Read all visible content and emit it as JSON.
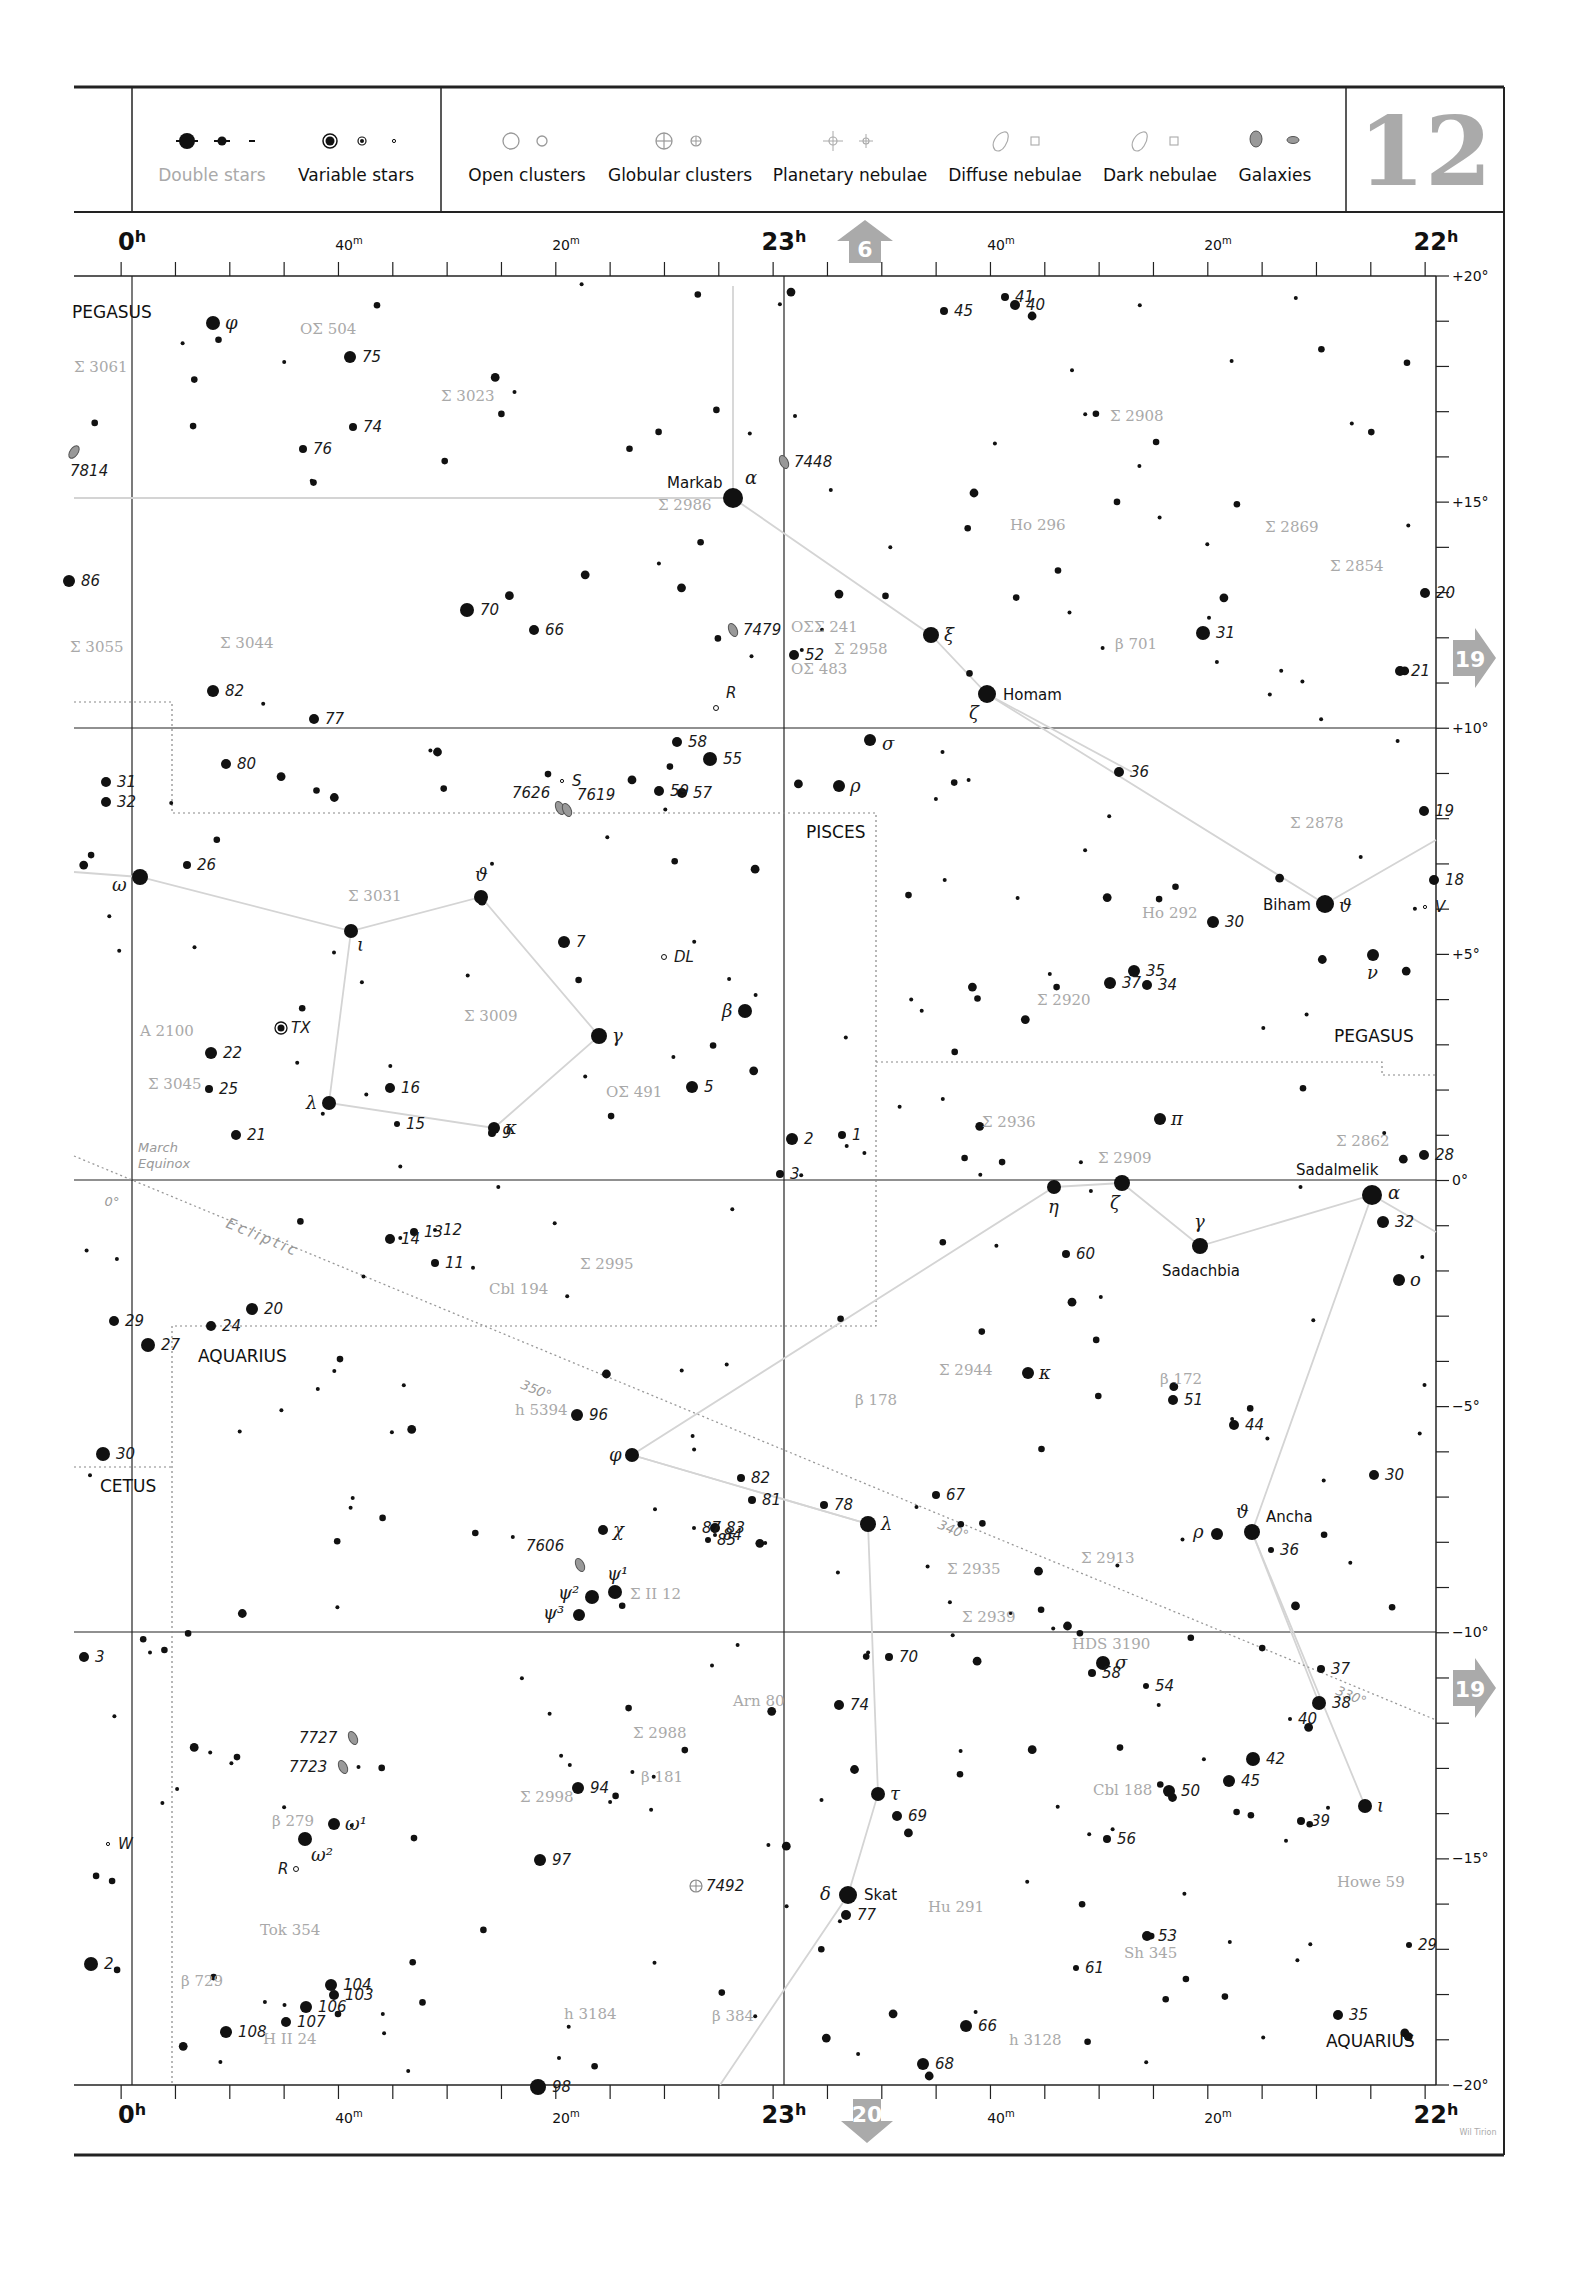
{
  "page": {
    "number": "12",
    "credit": "Wil Tirion"
  },
  "legend": {
    "items": [
      {
        "label": "Double stars",
        "muted": true
      },
      {
        "label": "Variable stars"
      },
      {
        "label": "Open clusters"
      },
      {
        "label": "Globular clusters"
      },
      {
        "label": "Planetary nebulae"
      },
      {
        "label": "Diffuse nebulae"
      },
      {
        "label": "Dark nebulae"
      },
      {
        "label": "Galaxies"
      }
    ]
  },
  "navigation": {
    "up": "6",
    "right_upper": "19",
    "right_lower": "19",
    "down": "20"
  },
  "axes": {
    "ra_top": [
      {
        "label": "0h",
        "major": true,
        "x": 132
      },
      {
        "label": "40m",
        "x": 349
      },
      {
        "label": "20m",
        "x": 566
      },
      {
        "label": "23h",
        "major": true,
        "x": 784
      },
      {
        "label": "40m",
        "x": 1001
      },
      {
        "label": "20m",
        "x": 1218
      },
      {
        "label": "22h",
        "major": true,
        "x": 1436
      }
    ],
    "dec_right": [
      {
        "label": "+20°",
        "y": 276
      },
      {
        "label": "+15°",
        "y": 502
      },
      {
        "label": "+10°",
        "y": 728
      },
      {
        "label": "+5°",
        "y": 954
      },
      {
        "label": "0°",
        "y": 1180
      },
      {
        "label": "−5°",
        "y": 1406
      },
      {
        "label": "−10°",
        "y": 1632
      },
      {
        "label": "−15°",
        "y": 1858
      },
      {
        "label": "−20°",
        "y": 2085
      }
    ]
  },
  "constellations": [
    {
      "name": "PEGASUS",
      "x": 72,
      "y": 318
    },
    {
      "name": "PISCES",
      "x": 806,
      "y": 838
    },
    {
      "name": "PEGASUS",
      "x": 1334,
      "y": 1042
    },
    {
      "name": "AQUARIUS",
      "x": 198,
      "y": 1362
    },
    {
      "name": "CETUS",
      "x": 100,
      "y": 1492
    },
    {
      "name": "AQUARIUS",
      "x": 1326,
      "y": 2047
    }
  ],
  "ecliptic": {
    "label": "Ecliptic",
    "marks": [
      {
        "label": "0°",
        "x": 112,
        "y": 1198
      },
      {
        "label": "350°",
        "x": 520,
        "y": 1380
      },
      {
        "label": "340°",
        "x": 937,
        "y": 1523
      },
      {
        "label": "330°",
        "x": 1340,
        "y": 1691
      }
    ],
    "equinox": [
      "March",
      "Equinox"
    ]
  },
  "named_stars": [
    {
      "name": "Markab",
      "greek": "α",
      "x": 733,
      "y": 498,
      "r": 10
    },
    {
      "name": "Homam",
      "greek": "ζ",
      "x": 987,
      "y": 694,
      "r": 9
    },
    {
      "name": "Biham",
      "greek": "ϑ",
      "x": 1325,
      "y": 904,
      "r": 9
    },
    {
      "name": "Sadalmelik",
      "greek": "α",
      "x": 1372,
      "y": 1195,
      "r": 10
    },
    {
      "name": "Sadachbia",
      "greek": "γ",
      "x": 1200,
      "y": 1246,
      "r": 8
    },
    {
      "name": "Ancha",
      "greek": "ϑ",
      "x": 1252,
      "y": 1532,
      "r": 8
    },
    {
      "name": "Skat",
      "greek": "δ",
      "x": 848,
      "y": 1895,
      "r": 9
    }
  ],
  "greek_stars": [
    {
      "g": "φ",
      "x": 213,
      "y": 323,
      "r": 7
    },
    {
      "g": "ξ",
      "x": 931,
      "y": 635,
      "r": 8
    },
    {
      "g": "σ",
      "x": 870,
      "y": 740,
      "r": 6
    },
    {
      "g": "ρ",
      "x": 839,
      "y": 786,
      "r": 6
    },
    {
      "g": "ω",
      "x": 140,
      "y": 877,
      "r": 8
    },
    {
      "g": "ϑ",
      "x": 481,
      "y": 897,
      "r": 7
    },
    {
      "g": "ι",
      "x": 351,
      "y": 931,
      "r": 7
    },
    {
      "g": "β",
      "x": 745,
      "y": 1011,
      "r": 7
    },
    {
      "g": "γ",
      "x": 599,
      "y": 1036,
      "r": 8
    },
    {
      "g": "λ",
      "x": 329,
      "y": 1103,
      "r": 7
    },
    {
      "g": "κ",
      "x": 494,
      "y": 1128,
      "r": 6
    },
    {
      "g": "ν",
      "x": 1373,
      "y": 955,
      "r": 6
    },
    {
      "g": "π",
      "x": 1160,
      "y": 1119,
      "r": 6
    },
    {
      "g": "η",
      "x": 1054,
      "y": 1187,
      "r": 7
    },
    {
      "g": "ζ",
      "x": 1122,
      "y": 1183,
      "r": 8
    },
    {
      "g": "ο",
      "x": 1399,
      "y": 1280,
      "r": 6
    },
    {
      "g": "κ",
      "x": 1028,
      "y": 1373,
      "r": 6
    },
    {
      "g": "φ",
      "x": 632,
      "y": 1455,
      "r": 7
    },
    {
      "g": "λ",
      "x": 868,
      "y": 1524,
      "r": 8
    },
    {
      "g": "ρ",
      "x": 1217,
      "y": 1534,
      "r": 6
    },
    {
      "g": "χ",
      "x": 603,
      "y": 1530,
      "r": 5
    },
    {
      "g": "ψ¹",
      "x": 615,
      "y": 1592,
      "r": 7
    },
    {
      "g": "ψ²",
      "x": 592,
      "y": 1597,
      "r": 7
    },
    {
      "g": "ψ³",
      "x": 579,
      "y": 1615,
      "r": 6
    },
    {
      "g": "σ",
      "x": 1103,
      "y": 1663,
      "r": 7
    },
    {
      "g": "τ",
      "x": 878,
      "y": 1794,
      "r": 7
    },
    {
      "g": "ι",
      "x": 1365,
      "y": 1806,
      "r": 7
    },
    {
      "g": "ω¹",
      "x": 334,
      "y": 1824,
      "r": 6
    },
    {
      "g": "ω²",
      "x": 305,
      "y": 1839,
      "r": 7
    }
  ],
  "numbered_stars": [
    {
      "n": "75",
      "x": 350,
      "y": 357,
      "r": 6
    },
    {
      "n": "74",
      "x": 353,
      "y": 427,
      "r": 4
    },
    {
      "n": "76",
      "x": 303,
      "y": 449,
      "r": 4
    },
    {
      "n": "7814",
      "x": 86,
      "y": 462,
      "r": 0,
      "galaxy": true
    },
    {
      "n": "45",
      "x": 944,
      "y": 311,
      "r": 4
    },
    {
      "n": "41",
      "x": 1005,
      "y": 297,
      "r": 4
    },
    {
      "n": "40",
      "x": 1015,
      "y": 305,
      "r": 5
    },
    {
      "n": "86",
      "x": 69,
      "y": 581,
      "r": 6
    },
    {
      "n": "70",
      "x": 467,
      "y": 610,
      "r": 7
    },
    {
      "n": "66",
      "x": 534,
      "y": 630,
      "r": 5
    },
    {
      "n": "82",
      "x": 213,
      "y": 691,
      "r": 6
    },
    {
      "n": "77",
      "x": 314,
      "y": 719,
      "r": 5
    },
    {
      "n": "80",
      "x": 226,
      "y": 764,
      "r": 5
    },
    {
      "n": "31",
      "x": 106,
      "y": 782,
      "r": 5
    },
    {
      "n": "32",
      "x": 106,
      "y": 802,
      "r": 5
    },
    {
      "n": "52",
      "x": 794,
      "y": 655,
      "r": 5
    },
    {
      "n": "58",
      "x": 677,
      "y": 742,
      "r": 5
    },
    {
      "n": "55",
      "x": 710,
      "y": 759,
      "r": 7
    },
    {
      "n": "59",
      "x": 659,
      "y": 791,
      "r": 5
    },
    {
      "n": "57",
      "x": 682,
      "y": 793,
      "r": 5
    },
    {
      "n": "31",
      "x": 1203,
      "y": 633,
      "r": 7
    },
    {
      "n": "20",
      "x": 1425,
      "y": 593,
      "r": 5
    },
    {
      "n": "21",
      "x": 1400,
      "y": 671,
      "r": 5
    },
    {
      "n": "36",
      "x": 1119,
      "y": 772,
      "r": 5
    },
    {
      "n": "19",
      "x": 1424,
      "y": 811,
      "r": 5
    },
    {
      "n": "18",
      "x": 1434,
      "y": 880,
      "r": 5
    },
    {
      "n": "26",
      "x": 187,
      "y": 865,
      "r": 4
    },
    {
      "n": "7",
      "x": 564,
      "y": 942,
      "r": 6
    },
    {
      "n": "30",
      "x": 1213,
      "y": 922,
      "r": 6
    },
    {
      "n": "35",
      "x": 1134,
      "y": 971,
      "r": 6
    },
    {
      "n": "37",
      "x": 1110,
      "y": 983,
      "r": 6
    },
    {
      "n": "34",
      "x": 1147,
      "y": 985,
      "r": 5
    },
    {
      "n": "22",
      "x": 211,
      "y": 1053,
      "r": 6
    },
    {
      "n": "25",
      "x": 209,
      "y": 1089,
      "r": 4
    },
    {
      "n": "16",
      "x": 390,
      "y": 1088,
      "r": 5
    },
    {
      "n": "5",
      "x": 692,
      "y": 1087,
      "r": 6
    },
    {
      "n": "21",
      "x": 236,
      "y": 1135,
      "r": 5
    },
    {
      "n": "15",
      "x": 397,
      "y": 1124,
      "r": 3
    },
    {
      "n": "9",
      "x": 492,
      "y": 1133,
      "r": 4
    },
    {
      "n": "2",
      "x": 792,
      "y": 1139,
      "r": 6
    },
    {
      "n": "1",
      "x": 842,
      "y": 1135,
      "r": 4
    },
    {
      "n": "3",
      "x": 780,
      "y": 1174,
      "r": 4
    },
    {
      "n": "28",
      "x": 1424,
      "y": 1155,
      "r": 5
    },
    {
      "n": "32",
      "x": 1383,
      "y": 1222,
      "r": 6
    },
    {
      "n": "13",
      "x": 414,
      "y": 1232,
      "r": 4
    },
    {
      "n": "12",
      "x": 435,
      "y": 1230,
      "r": 2
    },
    {
      "n": "14",
      "x": 390,
      "y": 1239,
      "r": 5
    },
    {
      "n": "11",
      "x": 435,
      "y": 1263,
      "r": 4
    },
    {
      "n": "60",
      "x": 1066,
      "y": 1254,
      "r": 4
    },
    {
      "n": "29",
      "x": 114,
      "y": 1321,
      "r": 5
    },
    {
      "n": "27",
      "x": 148,
      "y": 1345,
      "r": 7
    },
    {
      "n": "24",
      "x": 211,
      "y": 1326,
      "r": 5
    },
    {
      "n": "20",
      "x": 252,
      "y": 1309,
      "r": 6
    },
    {
      "n": "96",
      "x": 577,
      "y": 1415,
      "r": 6
    },
    {
      "n": "51",
      "x": 1173,
      "y": 1400,
      "r": 5
    },
    {
      "n": "44",
      "x": 1234,
      "y": 1425,
      "r": 5
    },
    {
      "n": "30",
      "x": 103,
      "y": 1454,
      "r": 7
    },
    {
      "n": "30",
      "x": 1374,
      "y": 1475,
      "r": 5
    },
    {
      "n": "82",
      "x": 741,
      "y": 1478,
      "r": 4
    },
    {
      "n": "81",
      "x": 752,
      "y": 1500,
      "r": 4
    },
    {
      "n": "78",
      "x": 824,
      "y": 1505,
      "r": 4
    },
    {
      "n": "67",
      "x": 936,
      "y": 1495,
      "r": 4
    },
    {
      "n": "87",
      "x": 694,
      "y": 1528,
      "r": 2
    },
    {
      "n": "83",
      "x": 715,
      "y": 1528,
      "r": 5
    },
    {
      "n": "84",
      "x": 715,
      "y": 1535,
      "r": 2
    },
    {
      "n": "85",
      "x": 708,
      "y": 1540,
      "r": 3
    },
    {
      "n": "36",
      "x": 1271,
      "y": 1550,
      "r": 3
    },
    {
      "n": "3",
      "x": 84,
      "y": 1657,
      "r": 5
    },
    {
      "n": "70",
      "x": 889,
      "y": 1657,
      "r": 4
    },
    {
      "n": "58",
      "x": 1092,
      "y": 1673,
      "r": 4
    },
    {
      "n": "54",
      "x": 1146,
      "y": 1686,
      "r": 3
    },
    {
      "n": "37",
      "x": 1321,
      "y": 1669,
      "r": 4
    },
    {
      "n": "38",
      "x": 1319,
      "y": 1703,
      "r": 7
    },
    {
      "n": "40",
      "x": 1290,
      "y": 1719,
      "r": 2
    },
    {
      "n": "74",
      "x": 839,
      "y": 1705,
      "r": 5
    },
    {
      "n": "42",
      "x": 1253,
      "y": 1759,
      "r": 7
    },
    {
      "n": "45",
      "x": 1229,
      "y": 1781,
      "r": 6
    },
    {
      "n": "50",
      "x": 1169,
      "y": 1791,
      "r": 6
    },
    {
      "n": "94",
      "x": 578,
      "y": 1788,
      "r": 6
    },
    {
      "n": "69",
      "x": 897,
      "y": 1816,
      "r": 5
    },
    {
      "n": "39",
      "x": 1301,
      "y": 1821,
      "r": 4
    },
    {
      "n": "56",
      "x": 1107,
      "y": 1839,
      "r": 4
    },
    {
      "n": "97",
      "x": 540,
      "y": 1860,
      "r": 6
    },
    {
      "n": "77",
      "x": 846,
      "y": 1915,
      "r": 5
    },
    {
      "n": "53",
      "x": 1147,
      "y": 1936,
      "r": 5
    },
    {
      "n": "29",
      "x": 1409,
      "y": 1945,
      "r": 3
    },
    {
      "n": "2",
      "x": 91,
      "y": 1964,
      "r": 7
    },
    {
      "n": "61",
      "x": 1076,
      "y": 1968,
      "r": 3
    },
    {
      "n": "104",
      "x": 331,
      "y": 1985,
      "r": 6
    },
    {
      "n": "103",
      "x": 334,
      "y": 1995,
      "r": 5
    },
    {
      "n": "106",
      "x": 306,
      "y": 2007,
      "r": 6
    },
    {
      "n": "107",
      "x": 286,
      "y": 2022,
      "r": 5
    },
    {
      "n": "108",
      "x": 226,
      "y": 2032,
      "r": 6
    },
    {
      "n": "35",
      "x": 1338,
      "y": 2015,
      "r": 5
    },
    {
      "n": "66",
      "x": 966,
      "y": 2026,
      "r": 6
    },
    {
      "n": "68",
      "x": 923,
      "y": 2064,
      "r": 6
    },
    {
      "n": "98",
      "x": 538,
      "y": 2087,
      "r": 8
    }
  ],
  "double_star_labels": [
    {
      "t": "OΣ 504",
      "x": 300,
      "y": 334
    },
    {
      "t": "Σ 3061",
      "x": 74,
      "y": 372
    },
    {
      "t": "Σ 3023",
      "x": 441,
      "y": 401
    },
    {
      "t": "Σ 2908",
      "x": 1110,
      "y": 421
    },
    {
      "t": "Σ 2986",
      "x": 658,
      "y": 510
    },
    {
      "t": "Ho 296",
      "x": 1010,
      "y": 530
    },
    {
      "t": "Σ 2869",
      "x": 1265,
      "y": 532
    },
    {
      "t": "Σ 2854",
      "x": 1330,
      "y": 571
    },
    {
      "t": "Σ 3055",
      "x": 70,
      "y": 652
    },
    {
      "t": "Σ 3044",
      "x": 220,
      "y": 648
    },
    {
      "t": "OΣΣ 241",
      "x": 791,
      "y": 632
    },
    {
      "t": "Σ 2958",
      "x": 834,
      "y": 654
    },
    {
      "t": "OΣ 483",
      "x": 791,
      "y": 674
    },
    {
      "t": "β 701",
      "x": 1115,
      "y": 649
    },
    {
      "t": "Σ 2878",
      "x": 1290,
      "y": 828
    },
    {
      "t": "Σ 3031",
      "x": 348,
      "y": 901
    },
    {
      "t": "Ho 292",
      "x": 1142,
      "y": 918
    },
    {
      "t": "Σ 2920",
      "x": 1037,
      "y": 1005
    },
    {
      "t": "Σ 3009",
      "x": 464,
      "y": 1021
    },
    {
      "t": "A 2100",
      "x": 140,
      "y": 1036
    },
    {
      "t": "Σ 3045",
      "x": 148,
      "y": 1089
    },
    {
      "t": "OΣ 491",
      "x": 606,
      "y": 1097
    },
    {
      "t": "Σ 2936",
      "x": 982,
      "y": 1127
    },
    {
      "t": "Σ 2909",
      "x": 1098,
      "y": 1163
    },
    {
      "t": "Σ 2862",
      "x": 1336,
      "y": 1146
    },
    {
      "t": "Σ 2995",
      "x": 580,
      "y": 1269
    },
    {
      "t": "Cbl 194",
      "x": 489,
      "y": 1294
    },
    {
      "t": "Σ 2944",
      "x": 939,
      "y": 1375
    },
    {
      "t": "β 178",
      "x": 855,
      "y": 1405
    },
    {
      "t": "β 172",
      "x": 1160,
      "y": 1384
    },
    {
      "t": "h 5394",
      "x": 515,
      "y": 1415
    },
    {
      "t": "Σ II 12",
      "x": 630,
      "y": 1599
    },
    {
      "t": "Σ 2935",
      "x": 947,
      "y": 1574
    },
    {
      "t": "Σ 2913",
      "x": 1081,
      "y": 1563
    },
    {
      "t": "Σ 2939",
      "x": 962,
      "y": 1622
    },
    {
      "t": "HDS 3190",
      "x": 1072,
      "y": 1649
    },
    {
      "t": "Arn 80",
      "x": 733,
      "y": 1706
    },
    {
      "t": "Σ 2988",
      "x": 633,
      "y": 1738
    },
    {
      "t": "β 181",
      "x": 641,
      "y": 1782
    },
    {
      "t": "Σ 2998",
      "x": 520,
      "y": 1802
    },
    {
      "t": "β 279",
      "x": 272,
      "y": 1826
    },
    {
      "t": "Cbl 188",
      "x": 1093,
      "y": 1795
    },
    {
      "t": "Tok 354",
      "x": 260,
      "y": 1935
    },
    {
      "t": "Hu 291",
      "x": 928,
      "y": 1912
    },
    {
      "t": "Howe 59",
      "x": 1337,
      "y": 1887
    },
    {
      "t": "Sh 345",
      "x": 1124,
      "y": 1958
    },
    {
      "t": "β 729",
      "x": 181,
      "y": 1986
    },
    {
      "t": "H II 24",
      "x": 263,
      "y": 2044
    },
    {
      "t": "h 3184",
      "x": 564,
      "y": 2019
    },
    {
      "t": "β 384",
      "x": 712,
      "y": 2021
    },
    {
      "t": "h 3128",
      "x": 1009,
      "y": 2045
    }
  ],
  "deep_sky": [
    {
      "id": "7448",
      "type": "galaxy",
      "x": 784,
      "y": 462
    },
    {
      "id": "7479",
      "type": "galaxy",
      "x": 733,
      "y": 630
    },
    {
      "id": "7626",
      "type": "galaxy",
      "x": 560,
      "y": 808
    },
    {
      "id": "7619",
      "type": "galaxy",
      "x": 567,
      "y": 810
    },
    {
      "id": "7606",
      "type": "galaxy",
      "x": 580,
      "y": 1565
    },
    {
      "id": "7727",
      "type": "galaxy",
      "x": 353,
      "y": 1738
    },
    {
      "id": "7723",
      "type": "galaxy",
      "x": 343,
      "y": 1767
    },
    {
      "id": "7492",
      "type": "globular",
      "x": 696,
      "y": 1886
    }
  ],
  "variables": [
    {
      "id": "TX",
      "x": 281,
      "y": 1028,
      "type": "ringed"
    },
    {
      "id": "DL",
      "x": 664,
      "y": 957,
      "type": "open"
    },
    {
      "id": "R",
      "x": 716,
      "y": 708,
      "type": "open"
    },
    {
      "id": "S",
      "x": 562,
      "y": 781,
      "type": "small"
    },
    {
      "id": "V",
      "x": 1425,
      "y": 907,
      "type": "small"
    },
    {
      "id": "W",
      "x": 108,
      "y": 1844,
      "type": "small"
    },
    {
      "id": "R",
      "x": 296,
      "y": 1869,
      "type": "open"
    }
  ]
}
